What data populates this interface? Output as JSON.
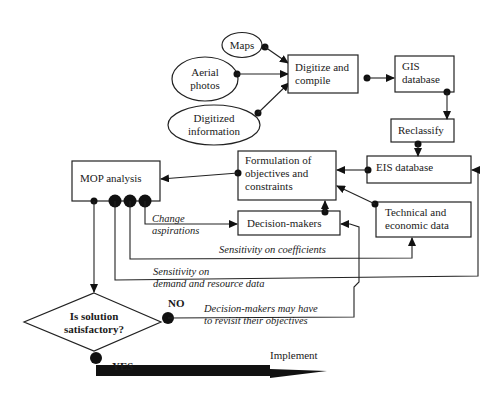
{
  "diagram": {
    "title": "",
    "sources": [
      {
        "id": "maps",
        "label_lines": [
          "Maps"
        ]
      },
      {
        "id": "aerial-photos",
        "label_lines": [
          "Aerial",
          "photos"
        ]
      },
      {
        "id": "digitized-information",
        "label_lines": [
          "Digitized",
          "information"
        ]
      }
    ],
    "boxes": {
      "digitize": {
        "label_lines": [
          "Digitize and",
          "compile"
        ]
      },
      "gis": {
        "label_lines": [
          "GIS",
          "database"
        ]
      },
      "reclassify": {
        "label_lines": [
          "Reclassify"
        ]
      },
      "eis": {
        "label_lines": [
          "EIS database"
        ]
      },
      "formulation": {
        "label_lines": [
          "Formulation of",
          "objectives and",
          "constraints"
        ]
      },
      "mop": {
        "label_lines": [
          "MOP analysis"
        ]
      },
      "decision_makers": {
        "label_lines": [
          "Decision-makers"
        ]
      },
      "technical": {
        "label_lines": [
          "Technical and",
          "economic data"
        ]
      }
    },
    "decision": {
      "label_lines": [
        "Is solution",
        "satisfactory?"
      ]
    },
    "edge_labels": {
      "change_aspirations": [
        "Change",
        "aspirations"
      ],
      "sensitivity_coefficients": "Sensitivity on coefficients",
      "sensitivity_demand": [
        "Sensitivity on",
        "demand and resource data"
      ],
      "revisit": [
        "Decision-makers may have",
        "to revisit their objectives"
      ],
      "no": "NO",
      "yes": "YES",
      "implement": "Implement"
    }
  }
}
